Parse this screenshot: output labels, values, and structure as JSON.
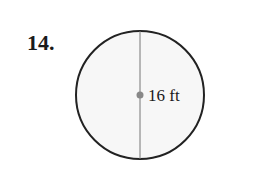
{
  "problem": {
    "number": "14.",
    "shape": "circle",
    "measure_label": "16 ft",
    "measure_type": "diameter-line with center point",
    "colors": {
      "stroke": "#222222",
      "fill": "#f7f7f7",
      "center_dot": "#888888",
      "diameter_line": "#777777"
    }
  }
}
